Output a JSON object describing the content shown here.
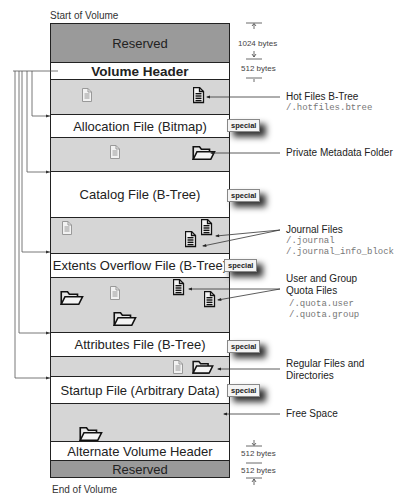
{
  "labels": {
    "start": "Start of Volume",
    "end": "End of Volume"
  },
  "regions": [
    {
      "name": "Reserved",
      "size": "1024 bytes"
    },
    {
      "name": "Volume Header",
      "size": "512 bytes"
    },
    {
      "name": ""
    },
    {
      "name": "Allocation File (Bitmap)",
      "badge": "special"
    },
    {
      "name": ""
    },
    {
      "name": "Catalog File (B-Tree)",
      "badge": "special"
    },
    {
      "name": ""
    },
    {
      "name": "Extents Overflow File (B-Tree)",
      "badge": "special"
    },
    {
      "name": ""
    },
    {
      "name": "Attributes File (B-Tree)",
      "badge": "special"
    },
    {
      "name": ""
    },
    {
      "name": "Startup File (Arbitrary Data)",
      "badge": "special"
    },
    {
      "name": ""
    },
    {
      "name": "Alternate Volume Header",
      "size": "512 bytes"
    },
    {
      "name": "Reserved",
      "size": "512 bytes"
    }
  ],
  "annotations": {
    "hotfiles": {
      "title": "Hot Files B-Tree",
      "path": "/.hotfiles.btree"
    },
    "private": {
      "title": "Private Metadata Folder"
    },
    "journal": {
      "title": "Journal Files",
      "paths": [
        "/.journal",
        "/.journal_info_block"
      ]
    },
    "quota": {
      "title": [
        "User and Group",
        "Quota Files"
      ],
      "paths": [
        "/.quota.user",
        "/.quota.group"
      ]
    },
    "regular": {
      "title": [
        "Regular Files and",
        "Directories"
      ]
    },
    "free": {
      "title": "Free Space"
    }
  },
  "colors": {
    "reserved": "#9a9a9a",
    "data_area": "#d6d6d6",
    "metadata": "#ffffff"
  }
}
